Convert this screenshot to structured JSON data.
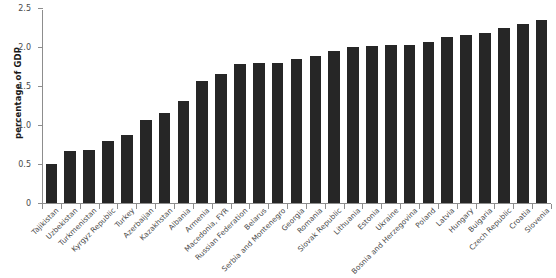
{
  "chart_data": {
    "type": "bar",
    "title": "",
    "xlabel": "",
    "ylabel": "percentage of GDP",
    "ylim": [
      0,
      2.5
    ],
    "yticks": [
      "0",
      "0.5",
      "1.0",
      "1.5",
      "2.0",
      "2.5"
    ],
    "ytick_values": [
      0,
      0.5,
      1.0,
      1.5,
      2.0,
      2.5
    ],
    "grid": false,
    "legend": null,
    "bar_color": "#262626",
    "axis_color": "#8d8d8d",
    "categories": [
      "Tajikistan",
      "Uzbekistan",
      "Turkmenistan",
      "Kyrgyz Republic",
      "Turkey",
      "Azerbaijan",
      "Kazakhstan",
      "Albania",
      "Armenia",
      "Macedonia, FYR",
      "Russian Federation",
      "Belarus",
      "Serbia and Montenegro",
      "Georgia",
      "Romania",
      "Slovak Republic",
      "Lithuania",
      "Estonia",
      "Ukraine",
      "Bosnia and Herzegovina",
      "Poland",
      "Latvia",
      "Hungary",
      "Bulgaria",
      "Czech Republic",
      "Croatia",
      "Slovenia"
    ],
    "values": [
      0.5,
      0.67,
      0.68,
      0.79,
      0.87,
      1.06,
      1.15,
      1.31,
      1.57,
      1.65,
      1.78,
      1.79,
      1.8,
      1.85,
      1.88,
      1.95,
      2.0,
      2.01,
      2.02,
      2.03,
      2.07,
      2.13,
      2.16,
      2.18,
      2.25,
      2.3,
      2.35
    ]
  }
}
